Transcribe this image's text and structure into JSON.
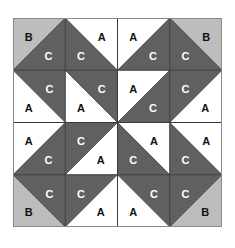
{
  "colors": {
    "A": "#ffffff",
    "B": "#bdbdbd",
    "C": "#606060",
    "grid_line": "#3a3a3a",
    "border": "#8a8a8a",
    "label_dark": "#111111",
    "label_light": "#ffffff"
  },
  "grid": {
    "rows": 4,
    "cols": 4
  },
  "cells": [
    [
      {
        "diag": "/",
        "a": {
          "pos": "tl",
          "label": "B"
        },
        "b": {
          "pos": "br",
          "label": "C"
        }
      },
      {
        "diag": "\\",
        "a": {
          "pos": "tr",
          "label": "A"
        },
        "b": {
          "pos": "bl",
          "label": "C"
        }
      },
      {
        "diag": "/",
        "a": {
          "pos": "tl",
          "label": "A"
        },
        "b": {
          "pos": "br",
          "label": "C"
        }
      },
      {
        "diag": "\\",
        "a": {
          "pos": "tr",
          "label": "B"
        },
        "b": {
          "pos": "bl",
          "label": "C"
        }
      }
    ],
    [
      {
        "diag": "\\",
        "a": {
          "pos": "tr",
          "label": "C"
        },
        "b": {
          "pos": "bl",
          "label": "A"
        }
      },
      {
        "diag": "\\",
        "a": {
          "pos": "tr",
          "label": "C"
        },
        "b": {
          "pos": "bl",
          "label": "A"
        }
      },
      {
        "diag": "/",
        "a": {
          "pos": "tl",
          "label": "A"
        },
        "b": {
          "pos": "br",
          "label": "C"
        }
      },
      {
        "diag": "/",
        "a": {
          "pos": "tl",
          "label": "C"
        },
        "b": {
          "pos": "br",
          "label": "A"
        }
      }
    ],
    [
      {
        "diag": "/",
        "a": {
          "pos": "tl",
          "label": "A"
        },
        "b": {
          "pos": "br",
          "label": "C"
        }
      },
      {
        "diag": "/",
        "a": {
          "pos": "tl",
          "label": "C"
        },
        "b": {
          "pos": "br",
          "label": "A"
        }
      },
      {
        "diag": "\\",
        "a": {
          "pos": "tr",
          "label": "A"
        },
        "b": {
          "pos": "bl",
          "label": "C"
        }
      },
      {
        "diag": "\\",
        "a": {
          "pos": "tr",
          "label": "A"
        },
        "b": {
          "pos": "bl",
          "label": "C"
        }
      }
    ],
    [
      {
        "diag": "\\",
        "a": {
          "pos": "tr",
          "label": "C"
        },
        "b": {
          "pos": "bl",
          "label": "B"
        }
      },
      {
        "diag": "/",
        "a": {
          "pos": "tl",
          "label": "C"
        },
        "b": {
          "pos": "br",
          "label": "A"
        }
      },
      {
        "diag": "\\",
        "a": {
          "pos": "tr",
          "label": "C"
        },
        "b": {
          "pos": "bl",
          "label": "A"
        }
      },
      {
        "diag": "/",
        "a": {
          "pos": "tl",
          "label": "C"
        },
        "b": {
          "pos": "br",
          "label": "B"
        }
      }
    ]
  ]
}
